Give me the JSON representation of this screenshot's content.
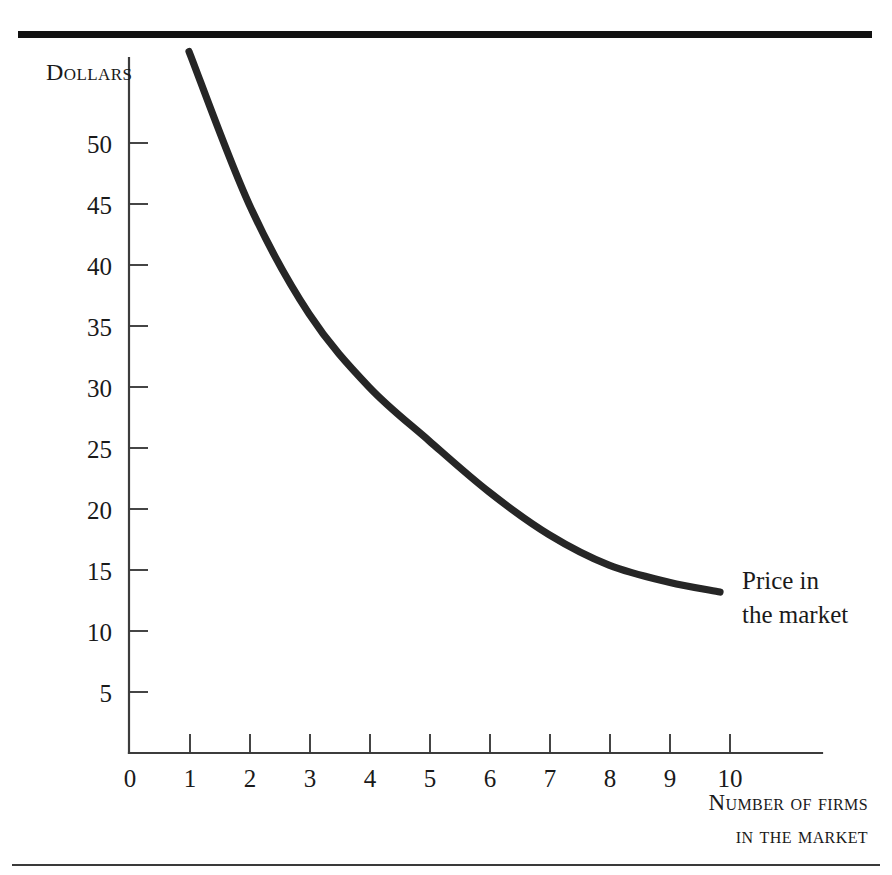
{
  "figure": {
    "background_color": "#ffffff",
    "ink_color": "#262626",
    "axis_color": "#3c3c3c",
    "top_rule": "top-rule",
    "bottom_rule": "bottom-rule"
  },
  "axes": {
    "y_title": "Dollars",
    "x_title_line1": "Number of firms",
    "x_title_line2": "in the market",
    "y_ticks": [
      "50",
      "45",
      "40",
      "35",
      "30",
      "25",
      "20",
      "15",
      "10",
      "5"
    ],
    "x_ticks": [
      "0",
      "1",
      "2",
      "3",
      "4",
      "5",
      "6",
      "7",
      "8",
      "9",
      "10"
    ]
  },
  "annotations": {
    "curve_label_line1": "Price in",
    "curve_label_line2": "the market"
  },
  "chart_data": {
    "type": "line",
    "title": "",
    "xlabel": "Number of firms in the market",
    "ylabel": "Dollars",
    "xlim": [
      0,
      11
    ],
    "ylim": [
      0,
      55
    ],
    "grid": false,
    "legend_position": "inline-right-of-curve",
    "x_tick_values": [
      0,
      1,
      2,
      3,
      4,
      5,
      6,
      7,
      8,
      9,
      10
    ],
    "y_tick_values": [
      5,
      10,
      15,
      20,
      25,
      30,
      35,
      40,
      45,
      50
    ],
    "series": [
      {
        "name": "Price in the market",
        "color": "#262626",
        "x": [
          1,
          2,
          3,
          4,
          5,
          6,
          7,
          8,
          9,
          9.85
        ],
        "values": [
          57.5,
          45.0,
          36.0,
          30.0,
          25.6,
          21.4,
          17.9,
          15.4,
          14.0,
          13.2
        ]
      }
    ]
  }
}
